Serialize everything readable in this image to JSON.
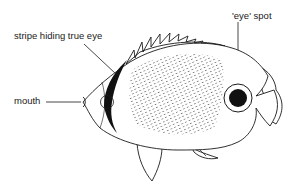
{
  "diagram": {
    "labels": {
      "stripe": "stripe hiding true eye",
      "eye_spot": "'eye' spot",
      "mouth": "mouth"
    },
    "colors": {
      "line": "#1a1a1a",
      "fill_dark": "#111111",
      "background": "#ffffff",
      "dots": "#555555"
    }
  }
}
